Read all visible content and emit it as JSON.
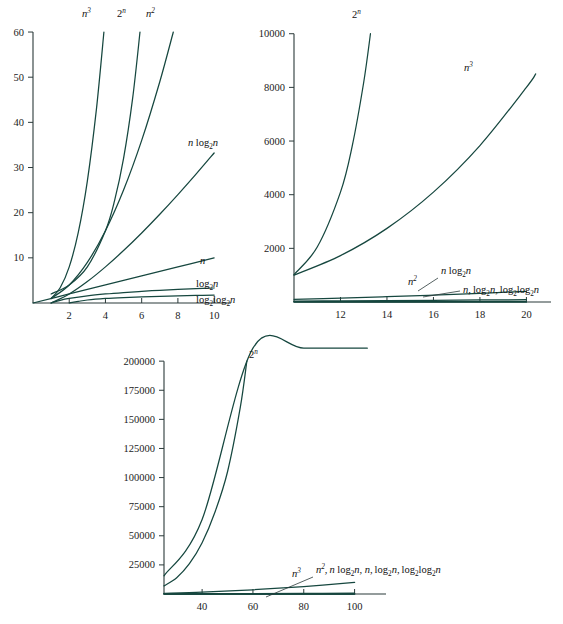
{
  "figure": {
    "background": "#ffffff",
    "curve_color": "#16473f",
    "axis_color": "#2b3a3a",
    "text_color": "#111111"
  },
  "chart_data": [
    {
      "id": "panel-1",
      "type": "line",
      "title": "",
      "xlabel": "",
      "ylabel": "",
      "xlim": [
        0,
        10.6
      ],
      "ylim": [
        0,
        62
      ],
      "grid": false,
      "legend_position": "inline-curve-labels",
      "xticks": [
        2,
        4,
        6,
        8,
        10
      ],
      "yticks": [
        10,
        20,
        30,
        40,
        50,
        60
      ],
      "xticklabels": [
        "2",
        "4",
        "6",
        "8",
        "10"
      ],
      "yticklabels": [
        "10",
        "20",
        "30",
        "40",
        "50",
        "60"
      ],
      "series": [
        {
          "name": "n^3",
          "label": "n3",
          "x": [
            1,
            1.5,
            2,
            2.5,
            3,
            3.5,
            3.915
          ],
          "values": [
            1,
            3.375,
            8,
            15.625,
            27,
            42.875,
            60
          ]
        },
        {
          "name": "2^n",
          "label": "2n",
          "x": [
            1,
            2,
            3,
            4,
            4.5,
            5,
            5.5,
            5.907
          ],
          "values": [
            2,
            4,
            8,
            16,
            22.6,
            32,
            45.3,
            60
          ]
        },
        {
          "name": "n^2",
          "label": "n2",
          "x": [
            1,
            2,
            3,
            4,
            5,
            6,
            7,
            7.746
          ],
          "values": [
            1,
            4,
            9,
            16,
            25,
            36,
            49,
            60
          ]
        },
        {
          "name": "n log2 n",
          "label": "nlog2n",
          "x": [
            1,
            2,
            3,
            4,
            5,
            6,
            7,
            8,
            9,
            10
          ],
          "values": [
            0,
            2,
            4.755,
            8,
            11.61,
            15.51,
            19.65,
            24,
            28.53,
            33.22
          ]
        },
        {
          "name": "n",
          "label": "n",
          "x": [
            0,
            2,
            4,
            6,
            8,
            10
          ],
          "values": [
            0,
            2,
            4,
            6,
            8,
            10
          ]
        },
        {
          "name": "log2 n",
          "label": "log2n",
          "x": [
            1,
            1.5,
            2,
            3,
            4,
            5,
            6,
            7,
            8,
            9,
            10
          ],
          "values": [
            0,
            0.585,
            1,
            1.585,
            2,
            2.322,
            2.585,
            2.807,
            3,
            3.17,
            3.322
          ]
        },
        {
          "name": "log2 log2 n",
          "label": "log2log2n",
          "x": [
            2,
            2.5,
            3,
            4,
            5,
            6,
            7,
            8,
            9,
            10
          ],
          "values": [
            0,
            0.357,
            0.664,
            1,
            1.215,
            1.37,
            1.489,
            1.585,
            1.664,
            1.732
          ]
        }
      ],
      "curve_labels": [
        {
          "text": "n3",
          "pos": "top",
          "x_px": 88,
          "y_px": 14
        },
        {
          "text": "2n",
          "pos": "top",
          "x_px": 124,
          "y_px": 14
        },
        {
          "text": "n2",
          "pos": "top",
          "x_px": 153,
          "y_px": 14
        },
        {
          "text": "nlog2n",
          "pos": "right",
          "x_px": 190,
          "y_px": 150
        },
        {
          "text": "n",
          "pos": "right",
          "x_px": 200,
          "y_px": 266
        },
        {
          "text": "log2n",
          "pos": "right",
          "x_px": 196,
          "y_px": 288
        },
        {
          "text": "log2log2n",
          "pos": "right",
          "x_px": 196,
          "y_px": 303
        }
      ]
    },
    {
      "id": "panel-2",
      "type": "line",
      "title": "",
      "xlabel": "",
      "ylabel": "",
      "xlim": [
        10,
        20.8
      ],
      "ylim": [
        0,
        10400
      ],
      "grid": false,
      "legend_position": "inline-curve-labels",
      "xticks": [
        12,
        14,
        16,
        18,
        20
      ],
      "yticks": [
        2000,
        4000,
        6000,
        8000,
        10000
      ],
      "xticklabels": [
        "12",
        "14",
        "16",
        "18",
        "20"
      ],
      "yticklabels": [
        "2000",
        "4000",
        "6000",
        "8000",
        "10000"
      ],
      "series": [
        {
          "name": "2^n",
          "label": "2n",
          "x": [
            10,
            11,
            12,
            12.5,
            13,
            13.29
          ],
          "values": [
            1024,
            2048,
            4096,
            5793,
            8192,
            10000
          ]
        },
        {
          "name": "n^3",
          "label": "n3",
          "x": [
            10,
            12,
            14,
            16,
            18,
            20,
            20.4
          ],
          "values": [
            1000,
            1728,
            2744,
            4096,
            5832,
            8000,
            8500
          ]
        },
        {
          "name": "n^2",
          "label": "n2",
          "x": [
            10,
            12,
            14,
            16,
            18,
            20
          ],
          "values": [
            100,
            144,
            196,
            256,
            324,
            400
          ]
        },
        {
          "name": "n log2 n",
          "label": "nlog2n",
          "x": [
            10,
            12,
            14,
            16,
            18,
            20
          ],
          "values": [
            33.2,
            43.0,
            53.3,
            64,
            75.1,
            86.4
          ]
        },
        {
          "name": "n",
          "label": "n",
          "x": [
            10,
            20
          ],
          "values": [
            10,
            20
          ]
        },
        {
          "name": "log2 n",
          "label": "log2n",
          "x": [
            10,
            20
          ],
          "values": [
            3.32,
            4.32
          ]
        },
        {
          "name": "log2 log2 n",
          "label": "log2log2n",
          "x": [
            10,
            20
          ],
          "values": [
            1.73,
            2.11
          ]
        }
      ],
      "curve_labels": [
        {
          "text": "2n",
          "pos": "top",
          "x_px": 101,
          "y_px": 14
        },
        {
          "text": "n3",
          "pos": "top",
          "x_px": 213,
          "y_px": 67
        },
        {
          "text": "n2",
          "pos": "inline",
          "x_px": 156,
          "y_px": 283
        },
        {
          "text": "nlog2n",
          "pos": "inline",
          "x_px": 195,
          "y_px": 272
        },
        {
          "text": "n,log2n,log2log2n",
          "pos": "inline",
          "x_px": 218,
          "y_px": 292
        }
      ]
    },
    {
      "id": "panel-3",
      "type": "line",
      "title": "",
      "xlabel": "",
      "ylabel": "",
      "xlim": [
        25,
        110
      ],
      "ylim": [
        0,
        207000
      ],
      "grid": false,
      "legend_position": "inline-curve-labels",
      "xticks": [
        40,
        60,
        80,
        100
      ],
      "yticks": [
        25000,
        50000,
        75000,
        100000,
        125000,
        150000,
        175000,
        200000
      ],
      "xticklabels": [
        "40",
        "60",
        "80",
        "100"
      ],
      "yticklabels": [
        "25000",
        "50000",
        "75000",
        "100000",
        "125000",
        "150000",
        "175000",
        "200000"
      ],
      "series": [
        {
          "name": "2^n",
          "label": "2n",
          "x": [
            25,
            30,
            35,
            40,
            45,
            50,
            55,
            57.6
          ],
          "values": [
            7000,
            14000,
            26000,
            44000,
            70000,
            105000,
            160000,
            200000
          ]
        },
        {
          "name": "n^3",
          "label": "n3",
          "x": [
            25,
            40,
            60,
            80,
            100,
            105
          ],
          "values": [
            15625,
            64000,
            216000,
            512000,
            1000000,
            1157625
          ]
        },
        {
          "name": "n^2",
          "label": "n2",
          "x": [
            25,
            40,
            60,
            80,
            100
          ],
          "values": [
            625,
            1600,
            3600,
            6400,
            10000
          ]
        },
        {
          "name": "n log2 n",
          "label": "nlog2n",
          "x": [
            25,
            40,
            60,
            80,
            100
          ],
          "values": [
            116,
            213,
            354,
            506,
            664
          ]
        },
        {
          "name": "n",
          "label": "n",
          "x": [
            25,
            100
          ],
          "values": [
            25,
            100
          ]
        },
        {
          "name": "log2 n",
          "label": "log2n",
          "x": [
            25,
            100
          ],
          "values": [
            4.64,
            6.64
          ]
        },
        {
          "name": "log2 log2 n",
          "label": "log2log2n",
          "x": [
            25,
            100
          ],
          "values": [
            2.21,
            2.73
          ]
        }
      ],
      "curve_labels": [
        {
          "text": "2n",
          "pos": "top",
          "x_px": 153,
          "y_px": 25
        },
        {
          "text": "n3",
          "pos": "inline",
          "x_px": 196,
          "y_px": 245
        },
        {
          "text": "n2,nlog2n,n,log2n,log2log2n",
          "pos": "inline",
          "x_px": 219,
          "y_px": 243
        }
      ]
    }
  ],
  "labels": {
    "n": "n",
    "n2": "n",
    "n2_sup": "2",
    "n3": "n",
    "n3_sup": "3",
    "two_n": "2",
    "two_n_sup": "n",
    "log": "log",
    "log_sub": "2",
    "panel1": {
      "lbl_n3_base": "n",
      "lbl_n3_sup": "3",
      "lbl_2n_base": "2",
      "lbl_2n_sup": "n",
      "lbl_n2_base": "n",
      "lbl_n2_sup": "2",
      "lbl_nlogn_n": "n",
      "lbl_nlogn_log": "log",
      "lbl_nlogn_sub": "2",
      "lbl_nlogn_tail": "n",
      "lbl_n": "n",
      "lbl_logn_log": "log",
      "lbl_logn_sub": "2",
      "lbl_logn_tail": "n",
      "lbl_loglogn_log1": "log",
      "lbl_loglogn_sub1": "2",
      "lbl_loglogn_log2": "log",
      "lbl_loglogn_sub2": "2",
      "lbl_loglogn_tail": "n"
    },
    "panel2": {
      "lbl_2n_base": "2",
      "lbl_2n_sup": "n",
      "lbl_n3_base": "n",
      "lbl_n3_sup": "3",
      "lbl_n2_base": "n",
      "lbl_n2_sup": "2",
      "lbl_nlogn_n": "n",
      "lbl_nlogn_log": "log",
      "lbl_nlogn_sub": "2",
      "lbl_nlogn_tail": "n",
      "lbl_group_n": "n,",
      "lbl_group_log": "log",
      "lbl_group_sub": "2",
      "lbl_group_mid": "n,",
      "lbl_group_log2a": "log",
      "lbl_group_sub2a": "2",
      "lbl_group_log2b": "log",
      "lbl_group_sub2b": "2",
      "lbl_group_tail": "n"
    },
    "panel3": {
      "lbl_2n_base": "2",
      "lbl_2n_sup": "n",
      "lbl_n3_base": "n",
      "lbl_n3_sup": "3",
      "lbl_group_n2": "n",
      "lbl_group_n2_sup": "2",
      "lbl_group_comma1": ",",
      "lbl_group_n": "n",
      "lbl_group_log": "log",
      "lbl_group_sub": "2",
      "lbl_group_n_mid": "n, n,",
      "lbl_group_log_b": "log",
      "lbl_group_sub_b": "2",
      "lbl_group_mid2": "n,",
      "lbl_group_log_c": "log",
      "lbl_group_sub_c": "2",
      "lbl_group_log_d": "log",
      "lbl_group_sub_d": "2",
      "lbl_group_tail": "n"
    }
  }
}
